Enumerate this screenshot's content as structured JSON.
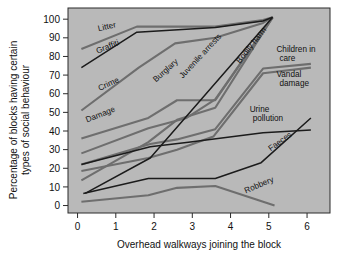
{
  "chart_data": {
    "type": "line",
    "title": "",
    "xlabel": "Overhead walkways joining the block",
    "ylabel": "Percentage of blocks having certain types of social behaviour",
    "xlim": [
      -0.25,
      6.6
    ],
    "ylim": [
      -4,
      106
    ],
    "xticks": [
      0,
      1,
      2,
      3,
      4,
      5,
      6
    ],
    "xtick_labels": [
      "0",
      "1",
      "2",
      "3",
      "4",
      "5",
      "6"
    ],
    "yticks": [
      0,
      10,
      20,
      30,
      40,
      50,
      60,
      70,
      80,
      90,
      100
    ],
    "ytick_labels": [
      "0",
      "10",
      "20",
      "30",
      "40",
      "50",
      "60",
      "70",
      "80",
      "90",
      "100"
    ],
    "grid": false,
    "legend": "inline-labels",
    "plot_background": "#b9b9b9",
    "series": [
      {
        "name": "Litter",
        "color": "#6e6e6e",
        "style": "gray",
        "label": "Litter",
        "label_x": 0.55,
        "label_y": 93.5,
        "label_rotation": -13,
        "x": [
          0.1,
          1.55,
          2.6,
          3.6,
          4.85,
          5.1
        ],
        "values": [
          84,
          96,
          96,
          96,
          99.5,
          101
        ]
      },
      {
        "name": "Graffiti",
        "color": "#1b1b1b",
        "style": "black",
        "label": "Graffiti",
        "label_x": 0.52,
        "label_y": 81.5,
        "label_rotation": -22,
        "x": [
          0.1,
          1.55,
          3.6,
          4.85,
          5.1
        ],
        "values": [
          74,
          93,
          95.5,
          99,
          101
        ]
      },
      {
        "name": "Crime",
        "color": "#6e6e6e",
        "style": "gray",
        "label": "Crime",
        "label_x": 0.58,
        "label_y": 61.5,
        "label_rotation": -25,
        "x": [
          0.1,
          1.6,
          2.55,
          3.6,
          4.85,
          5.1
        ],
        "values": [
          51,
          74,
          87,
          90,
          98,
          101
        ]
      },
      {
        "name": "Damage",
        "color": "#6e6e6e",
        "style": "gray",
        "label": "Damage",
        "label_x": 0.25,
        "label_y": 44.5,
        "label_rotation": -22,
        "x": [
          0.1,
          1.85,
          2.6,
          3.6,
          5.1
        ],
        "values": [
          36,
          47,
          56.5,
          56.5,
          101
        ]
      },
      {
        "name": "Burglary",
        "color": "#6e6e6e",
        "style": "gray",
        "label": "Burglary",
        "label_x": 2.05,
        "label_y": 66,
        "label_rotation": -42,
        "x": [
          0.1,
          1.85,
          2.6,
          3.6,
          5.1
        ],
        "values": [
          13.5,
          34,
          46,
          52.5,
          101
        ]
      },
      {
        "name": "Juvenile arrests",
        "color": "#1b1b1b",
        "style": "black",
        "label": "Juvenile arrests",
        "label_x": 2.75,
        "label_y": 68,
        "label_rotation": -47,
        "x": [
          0.2,
          1.9,
          5.1
        ],
        "values": [
          6.5,
          25.5,
          101
        ]
      },
      {
        "name": "Bodily harm",
        "color": "#6e6e6e",
        "style": "gray",
        "label": "Bodily harm",
        "label_x": 4.25,
        "label_y": 76,
        "label_rotation": -52,
        "x": [
          0.1,
          1.85,
          2.85,
          3.6,
          5.1
        ],
        "values": [
          28,
          41.5,
          47,
          57,
          101
        ]
      },
      {
        "name": "Children in care",
        "color": "#6e6e6e",
        "style": "gray",
        "label": "Children in care",
        "label_x": 5.2,
        "label_y": 82.5,
        "label_rotation": 0,
        "x": [
          0.1,
          1.9,
          2.6,
          3.6,
          4.85,
          6.1
        ],
        "values": [
          22,
          33,
          35.5,
          41,
          73.5,
          76
        ]
      },
      {
        "name": "Vandal damage",
        "color": "#6e6e6e",
        "style": "gray",
        "label": "Vandal damage",
        "label_x": 5.2,
        "label_y": 69,
        "label_rotation": 0,
        "x": [
          0.1,
          1.85,
          2.6,
          3.55,
          4.85,
          6.1
        ],
        "values": [
          18.5,
          25.5,
          30,
          37,
          71,
          74
        ]
      },
      {
        "name": "Urine pollution",
        "color": "#1b1b1b",
        "style": "black",
        "label": "Urine pollution",
        "label_x": 4.5,
        "label_y": 50,
        "label_rotation": 0,
        "x": [
          0.1,
          1.9,
          2.9,
          4.85,
          6.1
        ],
        "values": [
          22,
          31.5,
          34,
          39,
          40.5
        ]
      },
      {
        "name": "Faeces",
        "color": "#1b1b1b",
        "style": "black",
        "label": "Faeces",
        "label_x": 5.05,
        "label_y": 29,
        "label_rotation": -36,
        "x": [
          0.15,
          1.85,
          3.6,
          4.8,
          6.1
        ],
        "values": [
          6.5,
          14.5,
          14.5,
          23,
          47
        ]
      },
      {
        "name": "Robbery",
        "color": "#6e6e6e",
        "style": "gray",
        "label": "Robbery",
        "label_x": 4.4,
        "label_y": 6.5,
        "label_rotation": -23,
        "x": [
          0.1,
          1.85,
          2.6,
          3.6,
          5.15
        ],
        "values": [
          2,
          5.5,
          9.5,
          10.5,
          0
        ]
      }
    ]
  }
}
